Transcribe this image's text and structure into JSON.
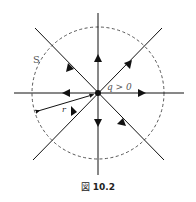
{
  "figure": {
    "caption_prefix": "図",
    "caption_number": "10.2",
    "labels": {
      "surface": "S",
      "charge": "q > 0",
      "radius": "r"
    },
    "colors": {
      "line": "#111111",
      "circle": "#444444"
    }
  }
}
